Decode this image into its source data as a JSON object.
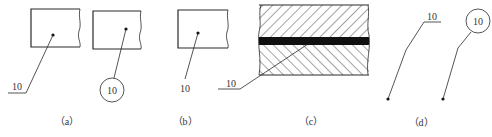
{
  "figure": {
    "stroke_color": "#2a2a2a",
    "panels": [
      {
        "id": "a",
        "caption": "（a）",
        "callouts": [
          {
            "style": "underline-leader",
            "label": "10"
          },
          {
            "style": "circle-leader",
            "label": "10"
          }
        ]
      },
      {
        "id": "b",
        "caption": "（b）",
        "callouts": [
          {
            "style": "plain-leader",
            "label": "10"
          }
        ]
      },
      {
        "id": "c",
        "caption": "（c）",
        "callouts": [
          {
            "style": "underline-leader-section",
            "label": "10"
          }
        ]
      },
      {
        "id": "d",
        "caption": "（d）",
        "callouts": [
          {
            "style": "underline-bent-leader",
            "label": "10"
          },
          {
            "style": "circle-bent-leader",
            "label": "10"
          }
        ]
      }
    ]
  }
}
